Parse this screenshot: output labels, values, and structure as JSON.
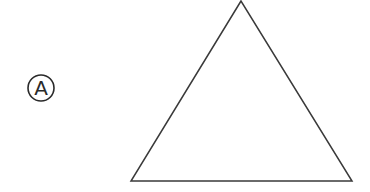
{
  "figure": {
    "label": {
      "text": "A",
      "style": "circled",
      "center": [
        41,
        88
      ],
      "radius": 13
    },
    "shape": {
      "type": "triangle",
      "vertices": [
        [
          241,
          1
        ],
        [
          131,
          181
        ],
        [
          352,
          181
        ]
      ],
      "stroke": "#3a3a3a",
      "fill": "none"
    }
  }
}
